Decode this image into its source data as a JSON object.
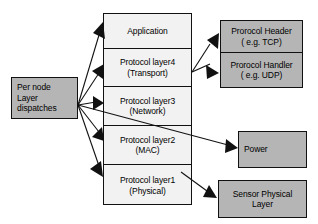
{
  "diagram": {
    "colors": {
      "gray_fill": "#b5b5b5",
      "light_fill": "#f2f2f2",
      "stroke": "#111111",
      "background": "#ffffff"
    },
    "dispatch": {
      "line1": "Per node",
      "line2": "Layer",
      "line3": "dispatches"
    },
    "stack": {
      "cells": [
        {
          "line1": "Application",
          "line2": ""
        },
        {
          "line1": "Protocol layer4",
          "line2": "(Transport)"
        },
        {
          "line1": "Protocol layer3",
          "line2": "(Network)"
        },
        {
          "line1": "Protocol layer2",
          "line2": "(MAC)"
        },
        {
          "line1": "Protocol layer1",
          "line2": "(Physical)"
        }
      ]
    },
    "right_nodes": {
      "protocol_header": {
        "line1": "Prorocol Header",
        "line2": "( e.g. TCP)"
      },
      "protocol_handler": {
        "line1": "Prorocol Handler",
        "line2": "( e.g. UDP)"
      },
      "power": {
        "line1": "Power",
        "line2": ""
      },
      "sensor_physical": {
        "line1": "Sensor Physical",
        "line2": "Layer"
      }
    },
    "edges": [
      {
        "name": "dispatch-to-application",
        "from": "dispatch",
        "to": "Application"
      },
      {
        "name": "dispatch-to-layer4",
        "from": "dispatch",
        "to": "Protocol layer4 (Transport)"
      },
      {
        "name": "dispatch-to-layer3",
        "from": "dispatch",
        "to": "Protocol layer3 (Network)"
      },
      {
        "name": "dispatch-to-layer2",
        "from": "dispatch",
        "to": "Protocol layer2 (MAC)"
      },
      {
        "name": "dispatch-to-layer1",
        "from": "dispatch",
        "to": "Protocol layer1 (Physical)"
      },
      {
        "name": "dispatch-to-power",
        "from": "dispatch",
        "to": "Power"
      },
      {
        "name": "layer4-to-protocol-header",
        "from": "Protocol layer4 (Transport)",
        "to": "Prorocol Header ( e.g. TCP)"
      },
      {
        "name": "layer4-to-protocol-handler",
        "from": "Protocol layer4 (Transport)",
        "to": "Prorocol Handler ( e.g. UDP)"
      },
      {
        "name": "layer1-to-sensor-physical",
        "from": "Protocol layer1 (Physical)",
        "to": "Sensor Physical Layer"
      }
    ]
  }
}
